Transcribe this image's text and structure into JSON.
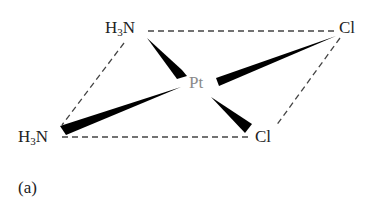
{
  "figure": {
    "panel_label": "(a)",
    "center_atom": "Pt",
    "ligands": {
      "top_left": {
        "prefix": "H",
        "subscript": "3",
        "suffix": "N"
      },
      "bottom_left": {
        "prefix": "H",
        "subscript": "3",
        "suffix": "N"
      },
      "top_right": "Cl",
      "bottom_right": "Cl"
    },
    "colors": {
      "bonds": "#000000",
      "dashes": "#444444",
      "pt_label": "#8a8a8a",
      "text": "#222222"
    }
  }
}
